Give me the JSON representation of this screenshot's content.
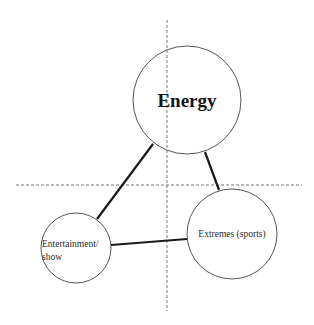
{
  "diagram": {
    "type": "triangle-of-circles",
    "axes": {
      "vertical": {
        "x": 167,
        "y1": 20,
        "y2": 311,
        "style": "dashed"
      },
      "horizontal": {
        "y": 185,
        "x1": 16,
        "x2": 302,
        "style": "dashed"
      }
    },
    "nodes": [
      {
        "id": "energy",
        "label": "Energy",
        "cx": 187,
        "cy": 100,
        "r": 54
      },
      {
        "id": "entertainment",
        "label_line1": "Entertainment/",
        "label_line2": "show",
        "cx": 76,
        "cy": 248,
        "r": 35
      },
      {
        "id": "extremes",
        "label": "Extremes (sports)",
        "cx": 232,
        "cy": 234,
        "r": 45
      }
    ],
    "edges": [
      {
        "from": "energy",
        "to": "entertainment"
      },
      {
        "from": "energy",
        "to": "extremes"
      },
      {
        "from": "entertainment",
        "to": "extremes"
      }
    ]
  },
  "colors": {
    "circle_stroke": "#555555",
    "edge": "#1a1a1a",
    "axis": "#777777"
  }
}
